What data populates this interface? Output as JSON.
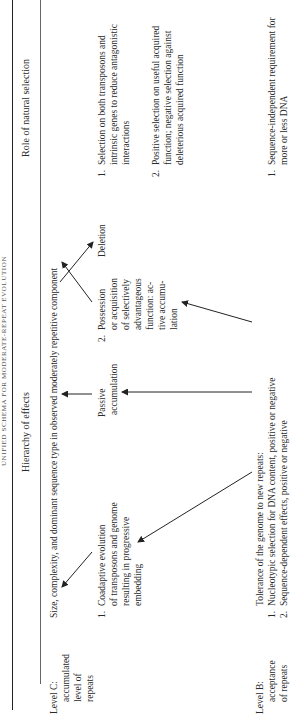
{
  "title": "UNIFIED SCHEMA FOR MODERATE-REPEAT EVOLUTION",
  "columns": {
    "hierarchy": "Hierarchy of effects",
    "role": "Role of natural selection"
  },
  "level_c": {
    "label_lines": [
      "Level C:",
      "accumulated",
      "level of",
      "repeats"
    ],
    "summary": "Size, complexity, and dominant sequence type in observed moderately repetitive component",
    "effects": {
      "item1": {
        "num": "1.",
        "lines": [
          "Coadaptive evolution",
          "of transposons and genome",
          "resulting in progressive",
          "embedding"
        ]
      },
      "passive": [
        "Passive",
        "accumulation"
      ],
      "item2": {
        "num": "2.",
        "lines": [
          "Possession",
          "or acquisition",
          "of selectively",
          "advantageous",
          "function: ac-",
          "tive accumu-",
          "lation"
        ]
      },
      "deletion": "Deletion"
    },
    "role": [
      {
        "num": "1.",
        "lines": [
          "Selection on both transposons and",
          "intrinsic genes to reduce antagonistic",
          "interactions"
        ]
      },
      {
        "num": "2.",
        "lines": [
          "Positive selection on useful acquired",
          "function; negative selection against",
          "deleterious acquired function"
        ]
      }
    ]
  },
  "level_b": {
    "label_lines": [
      "Level B:",
      "acceptance",
      "of repeats"
    ],
    "summary": "Tolerance of the genome to new repeats:",
    "effects": [
      {
        "num": "1.",
        "text": "Nucleotypic selection for DNA content, positive or negative"
      },
      {
        "num": "2.",
        "text": "Sequence-dependent effects, positive or negative"
      }
    ],
    "role": [
      {
        "num": "1.",
        "lines": [
          "Sequence-independent requirement for",
          "more or less DNA"
        ]
      }
    ]
  },
  "colors": {
    "text": "#2a2a2a",
    "rule": "#222222"
  }
}
